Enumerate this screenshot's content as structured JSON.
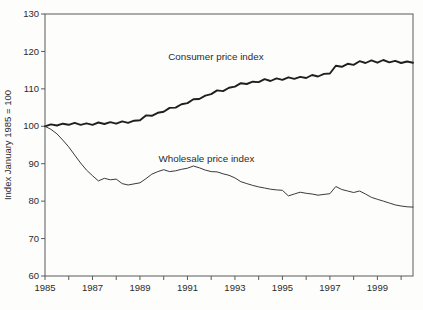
{
  "figure": {
    "background": "#fdfdfc",
    "frame_color": "#5a5a5a",
    "text_color": "#2b2b2b",
    "consumer_line_color": "#1f1f1f",
    "wholesale_line_color": "#3a3a3a"
  },
  "chart_data": {
    "type": "line",
    "title": "",
    "xlabel": "",
    "ylabel": "Index January 1985 = 100",
    "xlim": [
      1985,
      2000.5
    ],
    "ylim": [
      60,
      130
    ],
    "grid": false,
    "legend": "inline text annotations next to each line",
    "y_ticks": [
      60,
      70,
      80,
      90,
      100,
      110,
      120,
      130
    ],
    "x_major_tick_labels": [
      "1985",
      "1987",
      "1989",
      "1991",
      "1993",
      "1995",
      "1997",
      "1999"
    ],
    "x_major_ticks": [
      1985,
      1987,
      1989,
      1991,
      1993,
      1995,
      1997,
      1999
    ],
    "x_minor_tick_start": 1985,
    "x_minor_tick_end": 2000,
    "x_minor_tick_step": 1,
    "x_start": 1985,
    "x_step": 0.25,
    "annotations": [
      {
        "id": "consumer-label",
        "text": "Consumer price index",
        "x": 1992.2,
        "y": 118.5
      },
      {
        "id": "wholesale-label",
        "text": "Wholesale price index",
        "x": 1991.8,
        "y": 91.3
      }
    ],
    "series": [
      {
        "id": "consumer-price-line",
        "name": "Consumer price index",
        "stroke_width": 1.9,
        "values": [
          100.0,
          100.5,
          100.2,
          100.7,
          100.4,
          100.9,
          100.4,
          100.8,
          100.4,
          101.0,
          100.6,
          101.1,
          100.7,
          101.3,
          100.9,
          101.5,
          101.6,
          102.9,
          102.8,
          103.6,
          103.9,
          104.9,
          105.0,
          105.9,
          106.2,
          107.2,
          107.3,
          108.2,
          108.6,
          109.6,
          109.4,
          110.3,
          110.6,
          111.5,
          111.3,
          111.9,
          111.8,
          112.6,
          112.1,
          112.8,
          112.4,
          113.1,
          112.7,
          113.2,
          112.9,
          113.7,
          113.3,
          114.0,
          114.1,
          116.2,
          115.9,
          116.7,
          116.4,
          117.4,
          116.9,
          117.6,
          117.0,
          117.7,
          117.1,
          117.5,
          116.9,
          117.3,
          117.0
        ]
      },
      {
        "id": "wholesale-price-line",
        "name": "Wholesale price index",
        "stroke_width": 1.0,
        "values": [
          100.0,
          99.2,
          98.0,
          96.3,
          94.5,
          92.3,
          90.2,
          88.3,
          86.8,
          85.4,
          86.1,
          85.7,
          85.9,
          84.7,
          84.3,
          84.6,
          84.9,
          86.0,
          87.2,
          87.9,
          88.4,
          87.9,
          88.1,
          88.5,
          88.8,
          89.4,
          88.9,
          88.3,
          87.9,
          87.8,
          87.3,
          86.9,
          86.2,
          85.2,
          84.7,
          84.2,
          83.8,
          83.5,
          83.2,
          83.0,
          82.9,
          81.4,
          81.9,
          82.4,
          82.1,
          81.9,
          81.6,
          81.8,
          82.0,
          83.9,
          83.1,
          82.7,
          82.3,
          82.7,
          81.9,
          81.0,
          80.5,
          80.0,
          79.5,
          79.0,
          78.7,
          78.5,
          78.4
        ]
      }
    ]
  }
}
